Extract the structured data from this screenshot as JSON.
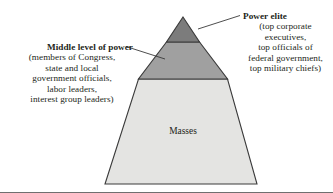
{
  "figure": {
    "type": "pyramid-diagram",
    "background_color": "#ffffff",
    "text_color": "#231f20",
    "outline_color": "#3a3a3a"
  },
  "pyramid": {
    "apex": {
      "x": 183,
      "y": 17
    },
    "base_left": {
      "x": 105,
      "y": 184
    },
    "base_right": {
      "x": 257,
      "y": 184
    },
    "tiers": [
      {
        "name": "power-elite",
        "label": "Power elite",
        "fill": "#7c7c7c",
        "top_y": 17,
        "bottom_y": 42
      },
      {
        "name": "middle-level-of-power",
        "label": "Middle level of power",
        "fill": "#a0a0a0",
        "top_y": 42,
        "bottom_y": 79
      },
      {
        "name": "masses",
        "label": "Masses",
        "fill": "#e4e4e2",
        "top_y": 79,
        "bottom_y": 184
      }
    ]
  },
  "masses": {
    "label": "Masses"
  },
  "callouts": {
    "power_elite": {
      "heading": "Power elite",
      "detail_lines": [
        "(top corporate",
        "executives,",
        "top officials of",
        "federal government,",
        "top military chiefs)"
      ],
      "leader_line": {
        "x1": 198,
        "y1": 29,
        "x2": 240,
        "y2": 15
      }
    },
    "middle_level_of_power": {
      "heading": "Middle level of power",
      "detail_lines": [
        "(members of Congress,",
        "state and local",
        "government officials,",
        "labor leaders,",
        "interest group leaders)"
      ],
      "leader_line": {
        "x1": 165,
        "y1": 59,
        "x2": 126,
        "y2": 46
      }
    }
  }
}
